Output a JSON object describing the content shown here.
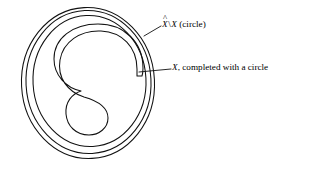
{
  "figure": {
    "background_color": "#ffffff",
    "stroke_color": "#111111",
    "annotations": [
      {
        "id": "xhat-minus-x",
        "symbol_base": "X",
        "symbol_accent": "̂",
        "separator": "\\",
        "symbol_second": "X",
        "suffix": " (circle)",
        "full_text": "X̂ \\ X (circle)",
        "leader": {
          "from_x": 144,
          "from_y": 36,
          "to_x": 161,
          "to_y": 26
        }
      },
      {
        "id": "x-completed",
        "symbol_base": "X",
        "suffix": ", completed with a circle",
        "full_text": "X, completed with a circle",
        "leader": {
          "from_x": 158,
          "from_y": 69,
          "to_x": 171,
          "to_y": 69
        }
      }
    ],
    "shapes": {
      "outer_circle_1": {
        "cx": 88,
        "cy": 83,
        "rx": 67,
        "ry": 76
      },
      "outer_circle_2": {
        "cx": 88,
        "cy": 82,
        "rx": 63,
        "ry": 72
      },
      "outer_circle_3": {
        "cx": 89,
        "cy": 81,
        "rx": 57,
        "ry": 66
      },
      "inner_s_curve": {
        "label": "S-shaped closed curve"
      }
    }
  }
}
